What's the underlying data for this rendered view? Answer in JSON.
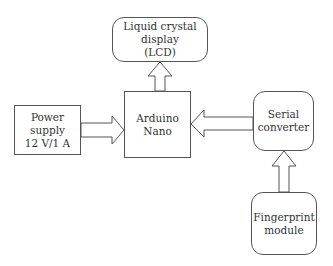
{
  "diagram": {
    "type": "block-diagram",
    "nodes": {
      "lcd": "Liquid crystal\ndisplay\n(LCD)",
      "power": "Power\nsupply\n12 V/1 A",
      "nano": "Arduino\nNano",
      "serial": "Serial\nconverter",
      "fingerprint": "Fingerprint\nmodule"
    },
    "edges": [
      {
        "from": "power",
        "to": "nano"
      },
      {
        "from": "nano",
        "to": "lcd"
      },
      {
        "from": "serial",
        "to": "nano"
      },
      {
        "from": "fingerprint",
        "to": "serial"
      }
    ],
    "colors": {
      "stroke": "#555555",
      "background": "#ffffff",
      "text": "#333333"
    }
  }
}
